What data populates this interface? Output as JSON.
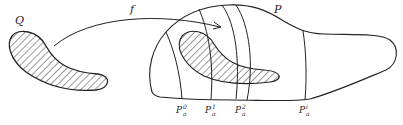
{
  "figure": {
    "labels": {
      "source_set": "Q",
      "map": "f",
      "target_region": "P",
      "slices": [
        {
          "base": "P",
          "sup": "0",
          "sub": "a"
        },
        {
          "base": "P",
          "sup": "1",
          "sub": "a"
        },
        {
          "base": "P",
          "sup": "2",
          "sub": "a"
        },
        {
          "base": "P",
          "sup": "i",
          "sub": "a"
        }
      ]
    },
    "colors": {
      "ink": "#222222",
      "background": "#ffffff"
    }
  }
}
